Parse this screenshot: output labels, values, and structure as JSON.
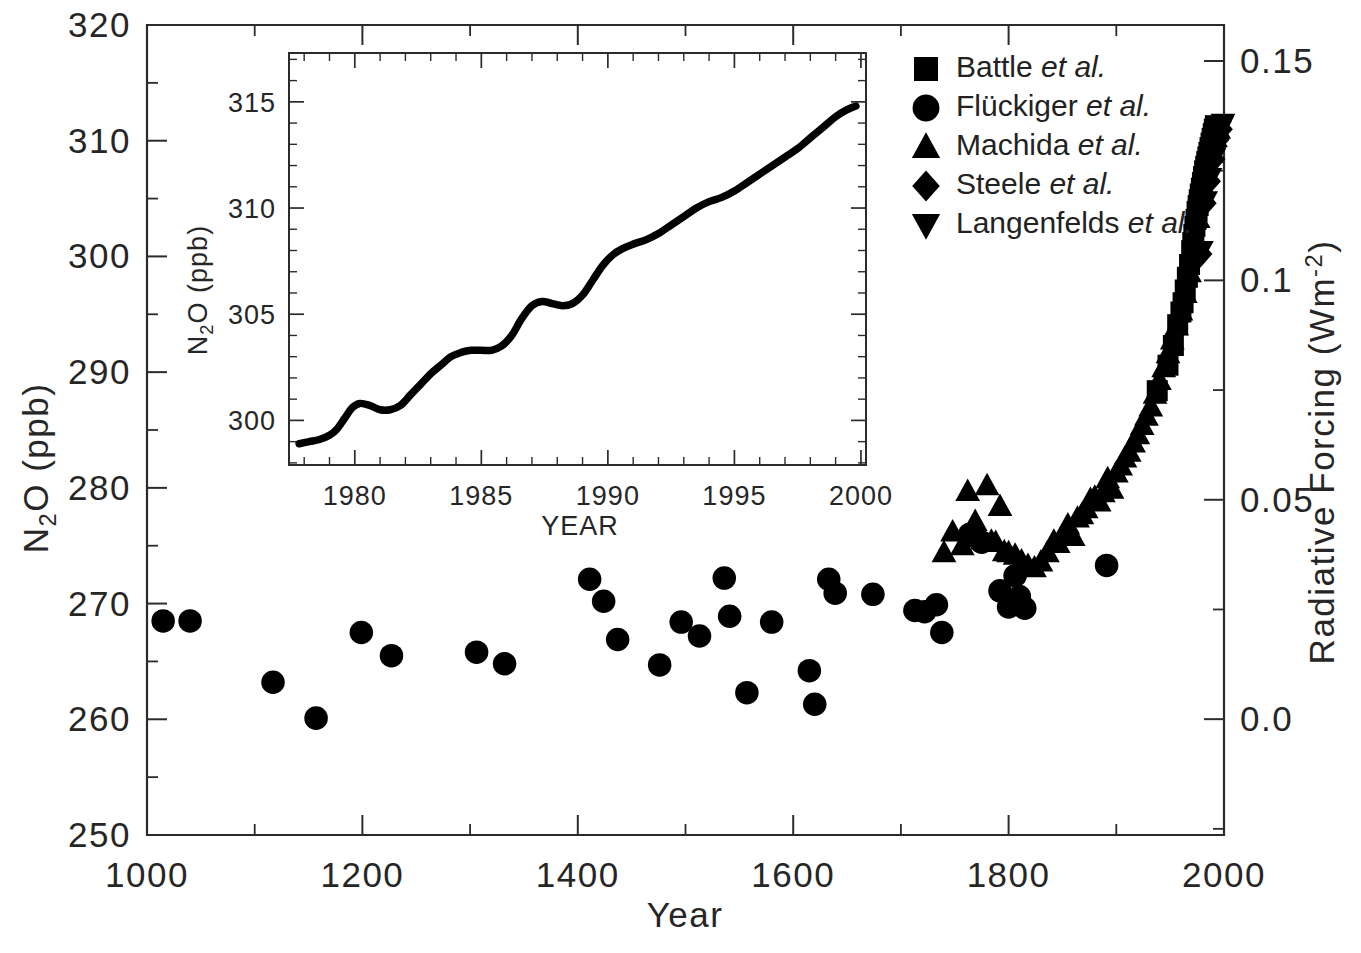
{
  "chart_data": {
    "type": "scatter",
    "title": "",
    "xlabel": "Year",
    "ylabel": "N2O (ppb)",
    "ylabel_right": "Radiative Forcing (Wm-2)",
    "xlim": [
      1000,
      2000
    ],
    "ylim": [
      250,
      320
    ],
    "ylim_right": [
      -0.0264,
      0.1582
    ],
    "grid": false,
    "legend_position": "top-right",
    "xticks": [
      1000,
      1200,
      1400,
      1600,
      1800,
      2000
    ],
    "xtick_labels": [
      "1000",
      "1200",
      "1400",
      "1600",
      "1800",
      "2000"
    ],
    "xticks_minor": [
      1100,
      1300,
      1500,
      1700,
      1900
    ],
    "yticks": [
      250,
      260,
      270,
      280,
      290,
      300,
      310,
      320
    ],
    "ytick_labels": [
      "250",
      "260",
      "270",
      "280",
      "290",
      "300",
      "310",
      "320"
    ],
    "yticks_minor": [
      255,
      265,
      275,
      285,
      295,
      305,
      315
    ],
    "yticks_right": [
      0.0,
      0.05,
      0.1,
      0.15
    ],
    "ytick_right_labels": [
      "0.0",
      "0.05",
      "0.1",
      "0.15"
    ],
    "series": [
      {
        "name": "Battle et al.",
        "marker": "square",
        "points": [
          [
            1938,
            288.4
          ],
          [
            1948,
            290.6
          ],
          [
            1953,
            292.3
          ],
          [
            1957,
            294.1
          ],
          [
            1960,
            295.2
          ],
          [
            1962,
            296.0
          ],
          [
            1964,
            297.1
          ],
          [
            1966,
            298.2
          ],
          [
            1968,
            299.3
          ],
          [
            1970,
            300.5
          ],
          [
            1971,
            301.2
          ],
          [
            1972,
            301.9
          ],
          [
            1973,
            302.6
          ],
          [
            1974,
            303.2
          ],
          [
            1975,
            303.9
          ],
          [
            1976,
            304.4
          ],
          [
            1977,
            304.9
          ],
          [
            1978,
            305.4
          ],
          [
            1979,
            305.9
          ],
          [
            1980,
            306.4
          ],
          [
            1981,
            306.9
          ],
          [
            1982,
            307.4
          ],
          [
            1983,
            307.8
          ],
          [
            1984,
            308.2
          ],
          [
            1985,
            308.6
          ],
          [
            1986,
            309.0
          ],
          [
            1987,
            309.4
          ],
          [
            1988,
            309.8
          ],
          [
            1989,
            310.2
          ],
          [
            1990,
            310.6
          ],
          [
            1991,
            311.0
          ],
          [
            1992,
            311.3
          ]
        ]
      },
      {
        "name": "Flückiger et al.",
        "marker": "circle",
        "points": [
          [
            1015,
            268.5
          ],
          [
            1040,
            268.5
          ],
          [
            1117,
            263.2
          ],
          [
            1157,
            260.1
          ],
          [
            1199,
            267.5
          ],
          [
            1227,
            265.5
          ],
          [
            1306,
            265.8
          ],
          [
            1332,
            264.8
          ],
          [
            1411,
            272.1
          ],
          [
            1424,
            270.2
          ],
          [
            1437,
            266.9
          ],
          [
            1476,
            264.7
          ],
          [
            1496,
            268.4
          ],
          [
            1513,
            267.2
          ],
          [
            1536,
            272.2
          ],
          [
            1541,
            268.9
          ],
          [
            1557,
            262.3
          ],
          [
            1580,
            268.4
          ],
          [
            1615,
            264.2
          ],
          [
            1620,
            261.3
          ],
          [
            1633,
            272.1
          ],
          [
            1639,
            270.9
          ],
          [
            1674,
            270.8
          ],
          [
            1713,
            269.4
          ],
          [
            1722,
            269.3
          ],
          [
            1733,
            269.9
          ],
          [
            1738,
            267.5
          ],
          [
            1764,
            276.0
          ],
          [
            1775,
            275.3
          ],
          [
            1792,
            271.1
          ],
          [
            1800,
            269.7
          ],
          [
            1806,
            272.4
          ],
          [
            1810,
            270.6
          ],
          [
            1815,
            269.6
          ],
          [
            1891,
            273.3
          ]
        ]
      },
      {
        "name": "Machida et al.",
        "marker": "triangle-up",
        "points": [
          [
            1740,
            274.4
          ],
          [
            1748,
            276.2
          ],
          [
            1757,
            275.0
          ],
          [
            1762,
            279.7
          ],
          [
            1769,
            277.1
          ],
          [
            1773,
            275.7
          ],
          [
            1776,
            275.5
          ],
          [
            1780,
            280.2
          ],
          [
            1784,
            275.4
          ],
          [
            1788,
            275.3
          ],
          [
            1792,
            278.4
          ],
          [
            1796,
            274.5
          ],
          [
            1800,
            274.4
          ],
          [
            1806,
            274.2
          ],
          [
            1812,
            273.7
          ],
          [
            1818,
            273.3
          ],
          [
            1824,
            273.1
          ],
          [
            1830,
            273.6
          ],
          [
            1836,
            274.4
          ],
          [
            1842,
            275.4
          ],
          [
            1846,
            275.2
          ],
          [
            1850,
            275.9
          ],
          [
            1855,
            276.8
          ],
          [
            1860,
            275.8
          ],
          [
            1864,
            277.4
          ],
          [
            1868,
            277.7
          ],
          [
            1872,
            278.2
          ],
          [
            1876,
            279.0
          ],
          [
            1880,
            279.2
          ],
          [
            1884,
            278.8
          ],
          [
            1888,
            279.6
          ],
          [
            1892,
            280.8
          ],
          [
            1896,
            279.9
          ],
          [
            1900,
            281.3
          ],
          [
            1904,
            281.9
          ],
          [
            1908,
            282.6
          ],
          [
            1912,
            283.1
          ],
          [
            1916,
            283.9
          ],
          [
            1920,
            284.6
          ],
          [
            1924,
            285.4
          ],
          [
            1928,
            286.2
          ],
          [
            1932,
            287.0
          ],
          [
            1936,
            288.1
          ],
          [
            1940,
            289.3
          ],
          [
            1944,
            290.4
          ],
          [
            1948,
            291.6
          ],
          [
            1952,
            292.8
          ],
          [
            1956,
            294.0
          ],
          [
            1960,
            295.3
          ],
          [
            1964,
            296.8
          ],
          [
            1968,
            298.6
          ],
          [
            1972,
            301.0
          ],
          [
            1976,
            303.3
          ],
          [
            1980,
            305.3
          ],
          [
            1984,
            307.2
          ],
          [
            1988,
            308.9
          ],
          [
            1992,
            310.3
          ],
          [
            1995,
            311.0
          ]
        ]
      },
      {
        "name": "Steele et al.",
        "marker": "diamond",
        "points": [
          [
            1978,
            300.2
          ],
          [
            1982,
            304.6
          ],
          [
            1986,
            306.5
          ],
          [
            1990,
            308.4
          ],
          [
            1994,
            310.1
          ],
          [
            1997,
            311.0
          ]
        ]
      },
      {
        "name": "Langenfelds et al.",
        "marker": "triangle-down",
        "points": [
          [
            1979,
            300.5
          ],
          [
            1983,
            304.8
          ],
          [
            1987,
            306.8
          ],
          [
            1991,
            308.6
          ],
          [
            1994,
            310.3
          ],
          [
            1996,
            310.9
          ],
          [
            1998,
            311.3
          ],
          [
            1999,
            311.5
          ]
        ]
      }
    ]
  },
  "inset_chart": {
    "type": "line",
    "title": "",
    "xlabel": "YEAR",
    "ylabel": "N2O (ppb)",
    "xlim": [
      1977.4,
      2000.2
    ],
    "ylim": [
      297.9,
      317.3
    ],
    "grid": false,
    "xticks": [
      1980,
      1985,
      1990,
      1995,
      2000
    ],
    "xtick_labels": [
      "1980",
      "1985",
      "1990",
      "1995",
      "2000"
    ],
    "yticks": [
      300,
      305,
      310,
      315
    ],
    "ytick_labels": [
      "300",
      "305",
      "310",
      "315"
    ],
    "x": [
      1977.8,
      1978.2,
      1978.6,
      1979.0,
      1979.3,
      1979.6,
      1979.9,
      1980.2,
      1980.6,
      1981.0,
      1981.4,
      1981.8,
      1982.2,
      1982.6,
      1983.0,
      1983.4,
      1983.8,
      1984.2,
      1984.6,
      1985.0,
      1985.4,
      1985.8,
      1986.2,
      1986.6,
      1987.0,
      1987.4,
      1987.8,
      1988.2,
      1988.6,
      1989.0,
      1989.4,
      1989.8,
      1990.2,
      1990.6,
      1991.0,
      1991.5,
      1992.0,
      1992.5,
      1993.0,
      1993.5,
      1994.0,
      1994.5,
      1995.0,
      1995.5,
      1996.0,
      1996.5,
      1997.0,
      1997.5,
      1998.0,
      1998.5,
      1999.0,
      1999.4,
      1999.8
    ],
    "y": [
      298.9,
      299.0,
      299.1,
      299.3,
      299.6,
      300.1,
      300.6,
      300.8,
      300.7,
      300.5,
      300.5,
      300.7,
      301.2,
      301.7,
      302.2,
      302.6,
      303.0,
      303.2,
      303.3,
      303.3,
      303.3,
      303.5,
      304.0,
      304.8,
      305.4,
      305.6,
      305.5,
      305.4,
      305.5,
      305.9,
      306.6,
      307.3,
      307.8,
      308.1,
      308.3,
      308.5,
      308.8,
      309.2,
      309.6,
      310.0,
      310.3,
      310.5,
      310.8,
      311.2,
      311.6,
      312.0,
      312.4,
      312.8,
      313.3,
      313.8,
      314.3,
      314.6,
      314.8
    ]
  },
  "legend": {
    "entries": [
      {
        "marker": "square",
        "name": "Battle",
        "suffix": "et al."
      },
      {
        "marker": "circle",
        "name": "Flückiger",
        "suffix": "et al."
      },
      {
        "marker": "triangle-up",
        "name": "Machida",
        "suffix": "et al."
      },
      {
        "marker": "diamond",
        "name": "Steele",
        "suffix": "et al."
      },
      {
        "marker": "triangle-down",
        "name": "Langenfelds",
        "suffix": "et al."
      }
    ]
  },
  "labels": {
    "y_axis_main_pre": "N",
    "y_axis_main_sub": "2",
    "y_axis_main_post": "O (ppb)",
    "x_axis_main": "Year",
    "y_axis_right_pre": "Radiative Forcing (Wm",
    "y_axis_right_sup": "-2",
    "y_axis_right_post": ")",
    "inset_y_pre": "N",
    "inset_y_sub": "2",
    "inset_y_post": "O (ppb)",
    "inset_x": "YEAR"
  },
  "colors": {
    "marker": "#000000",
    "axis": "#2b2b2b",
    "text": "#262626",
    "background": "#ffffff"
  }
}
